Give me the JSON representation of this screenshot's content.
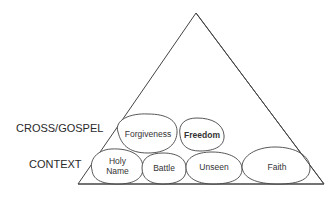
{
  "diagram": {
    "rows": [
      {
        "label": "CROSS/GOSPEL"
      },
      {
        "label": "CONTEXT"
      }
    ],
    "blobs": [
      {
        "label": "Forgiveness",
        "row": "CROSS/GOSPEL"
      },
      {
        "label": "Freedom",
        "row": "CROSS/GOSPEL",
        "bold": true
      },
      {
        "label": "Holy",
        "label2": "Name",
        "row": "CONTEXT"
      },
      {
        "label": "Battle",
        "row": "CONTEXT"
      },
      {
        "label": "Unseen",
        "row": "CONTEXT"
      },
      {
        "label": "Faith",
        "row": "CONTEXT"
      }
    ],
    "colors": {
      "stroke": "#333333",
      "background": "#ffffff"
    }
  }
}
